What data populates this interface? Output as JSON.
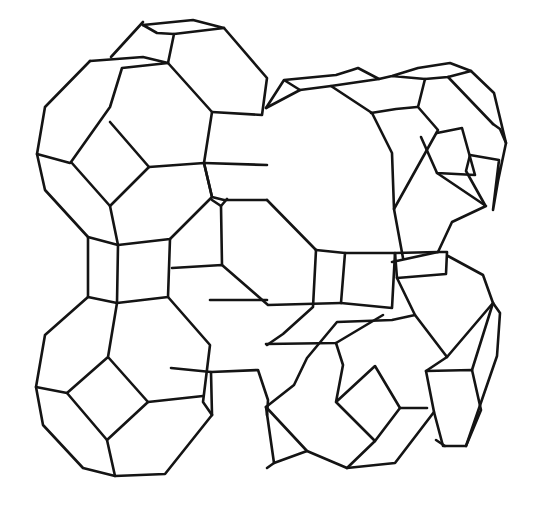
{
  "figure": {
    "stroke_color": "#141414",
    "background": "#ffffff",
    "polylines": [
      [
        [
          90,
          61
        ],
        [
          45,
          107
        ],
        [
          37,
          154
        ],
        [
          45,
          190
        ],
        [
          88,
          237
        ],
        [
          118,
          245
        ]
      ],
      [
        [
          90,
          61
        ],
        [
          143,
          57
        ],
        [
          168,
          63
        ],
        [
          122,
          68
        ],
        [
          110,
          107
        ],
        [
          71,
          162
        ],
        [
          110,
          206
        ],
        [
          149,
          167
        ],
        [
          110,
          122
        ]
      ],
      [
        [
          143,
          22
        ],
        [
          111,
          57
        ]
      ],
      [
        [
          143,
          25
        ],
        [
          193,
          20
        ],
        [
          224,
          28
        ],
        [
          174,
          34
        ],
        [
          168,
          63
        ]
      ],
      [
        [
          143,
          25
        ],
        [
          157,
          33
        ],
        [
          174,
          34
        ]
      ],
      [
        [
          37,
          154
        ],
        [
          70,
          163
        ]
      ],
      [
        [
          110,
          206
        ],
        [
          118,
          245
        ],
        [
          170,
          239
        ],
        [
          212,
          197
        ],
        [
          204,
          163
        ],
        [
          149,
          167
        ]
      ],
      [
        [
          168,
          63
        ],
        [
          212,
          112
        ],
        [
          204,
          163
        ]
      ],
      [
        [
          224,
          28
        ],
        [
          267,
          78
        ],
        [
          262,
          115
        ],
        [
          212,
          112
        ]
      ],
      [
        [
          204,
          163
        ],
        [
          267,
          165
        ]
      ],
      [
        [
          204,
          163
        ],
        [
          212,
          197
        ],
        [
          224,
          200
        ],
        [
          267,
          200
        ]
      ],
      [
        [
          88,
          237
        ],
        [
          88,
          297
        ],
        [
          117,
          303
        ],
        [
          118,
          245
        ]
      ],
      [
        [
          170,
          239
        ],
        [
          168,
          297
        ],
        [
          117,
          303
        ]
      ],
      [
        [
          168,
          297
        ],
        [
          210,
          345
        ],
        [
          203,
          402
        ],
        [
          212,
          415
        ]
      ],
      [
        [
          117,
          303
        ],
        [
          108,
          357
        ],
        [
          67,
          393
        ],
        [
          107,
          440
        ],
        [
          148,
          402
        ],
        [
          108,
          357
        ]
      ],
      [
        [
          88,
          297
        ],
        [
          45,
          335
        ],
        [
          36,
          387
        ],
        [
          67,
          393
        ]
      ],
      [
        [
          36,
          387
        ],
        [
          43,
          425
        ],
        [
          83,
          468
        ],
        [
          115,
          476
        ],
        [
          165,
          474
        ],
        [
          212,
          415
        ]
      ],
      [
        [
          107,
          440
        ],
        [
          115,
          476
        ]
      ],
      [
        [
          148,
          402
        ],
        [
          203,
          396
        ]
      ],
      [
        [
          267,
          300
        ],
        [
          210,
          300
        ]
      ],
      [
        [
          212,
          415
        ],
        [
          211,
          372
        ],
        [
          258,
          370
        ],
        [
          268,
          400
        ],
        [
          267,
          415
        ]
      ],
      [
        [
          211,
          372
        ],
        [
          171,
          368
        ]
      ],
      [
        [
          172,
          268
        ],
        [
          222,
          265
        ],
        [
          268,
          305
        ],
        [
          341,
          303
        ]
      ],
      [
        [
          222,
          265
        ],
        [
          221,
          206
        ],
        [
          227,
          199
        ]
      ],
      [
        [
          221,
          206
        ],
        [
          212,
          200
        ]
      ],
      [
        [
          267,
          200
        ],
        [
          316,
          250
        ]
      ],
      [
        [
          316,
          250
        ],
        [
          345,
          253
        ],
        [
          341,
          303
        ]
      ],
      [
        [
          316,
          250
        ],
        [
          313,
          307
        ],
        [
          283,
          334
        ],
        [
          267,
          345
        ]
      ],
      [
        [
          345,
          253
        ],
        [
          395,
          253
        ],
        [
          392,
          308
        ],
        [
          341,
          303
        ]
      ],
      [
        [
          266,
          108
        ],
        [
          284,
          80
        ],
        [
          336,
          75
        ],
        [
          352,
          70
        ],
        [
          358,
          68
        ],
        [
          379,
          79
        ],
        [
          331,
          86
        ],
        [
          300,
          90
        ],
        [
          284,
          80
        ]
      ],
      [
        [
          300,
          90
        ],
        [
          266,
          108
        ]
      ],
      [
        [
          331,
          86
        ],
        [
          372,
          113
        ],
        [
          392,
          153
        ],
        [
          394,
          209
        ],
        [
          403,
          258
        ]
      ],
      [
        [
          371,
          113
        ],
        [
          396,
          109
        ],
        [
          417,
          107
        ]
      ],
      [
        [
          379,
          79
        ],
        [
          392,
          76
        ],
        [
          418,
          68
        ],
        [
          450,
          63
        ],
        [
          471,
          71
        ],
        [
          448,
          77
        ],
        [
          425,
          79
        ],
        [
          392,
          76
        ]
      ],
      [
        [
          425,
          79
        ],
        [
          418,
          107
        ],
        [
          438,
          130
        ],
        [
          394,
          209
        ]
      ],
      [
        [
          471,
          71
        ],
        [
          494,
          93
        ],
        [
          506,
          143
        ],
        [
          498,
          181
        ],
        [
          493,
          210
        ],
        [
          499,
          160
        ],
        [
          470,
          155
        ],
        [
          466,
          171
        ],
        [
          485,
          205
        ]
      ],
      [
        [
          448,
          77
        ],
        [
          493,
          124
        ]
      ],
      [
        [
          493,
          124
        ],
        [
          500,
          129
        ],
        [
          506,
          143
        ]
      ],
      [
        [
          421,
          137
        ],
        [
          437,
          173
        ],
        [
          475,
          175
        ],
        [
          462,
          128
        ],
        [
          437,
          133
        ]
      ],
      [
        [
          437,
          173
        ],
        [
          486,
          206
        ],
        [
          452,
          222
        ],
        [
          438,
          252
        ]
      ],
      [
        [
          438,
          252
        ],
        [
          392,
          262
        ]
      ],
      [
        [
          395,
          253
        ],
        [
          438,
          252
        ],
        [
          447,
          252
        ],
        [
          446,
          274
        ],
        [
          397,
          278
        ],
        [
          395,
          253
        ]
      ],
      [
        [
          397,
          278
        ],
        [
          415,
          315
        ],
        [
          392,
          320
        ],
        [
          337,
          322
        ],
        [
          307,
          358
        ],
        [
          294,
          385
        ],
        [
          266,
          407
        ]
      ],
      [
        [
          266,
          344
        ],
        [
          336,
          343
        ],
        [
          383,
          315
        ]
      ],
      [
        [
          336,
          343
        ],
        [
          343,
          365
        ],
        [
          336,
          402
        ],
        [
          375,
          441
        ],
        [
          400,
          408
        ],
        [
          375,
          366
        ],
        [
          336,
          402
        ]
      ],
      [
        [
          266,
          407
        ],
        [
          307,
          451
        ],
        [
          347,
          468
        ],
        [
          395,
          463
        ],
        [
          434,
          412
        ],
        [
          426,
          371
        ],
        [
          447,
          357
        ],
        [
          415,
          315
        ]
      ],
      [
        [
          375,
          441
        ],
        [
          347,
          468
        ]
      ],
      [
        [
          400,
          408
        ],
        [
          427,
          408
        ]
      ],
      [
        [
          447,
          357
        ],
        [
          493,
          303
        ],
        [
          483,
          275
        ],
        [
          448,
          256
        ]
      ],
      [
        [
          493,
          303
        ],
        [
          500,
          313
        ],
        [
          497,
          356
        ],
        [
          466,
          446
        ],
        [
          445,
          446
        ],
        [
          436,
          440
        ]
      ],
      [
        [
          426,
          371
        ],
        [
          472,
          370
        ],
        [
          481,
          410
        ],
        [
          466,
          446
        ]
      ],
      [
        [
          472,
          370
        ],
        [
          493,
          303
        ]
      ],
      [
        [
          434,
          412
        ],
        [
          443,
          446
        ],
        [
          445,
          446
        ]
      ],
      [
        [
          266,
          407
        ],
        [
          274,
          463
        ],
        [
          267,
          468
        ]
      ],
      [
        [
          274,
          463
        ],
        [
          307,
          451
        ]
      ]
    ]
  }
}
